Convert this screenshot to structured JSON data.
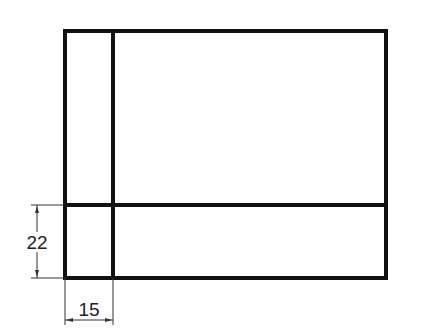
{
  "diagram": {
    "type": "technical-drawing",
    "outer_rect": {
      "x": 65,
      "y": 31,
      "width": 321,
      "height": 247
    },
    "vertical_divider_x": 113,
    "horizontal_divider_y": 205,
    "stroke_color": "#111111",
    "dimension_color": "#333333",
    "dimensions": [
      {
        "id": "height-dim",
        "label": "22",
        "orientation": "vertical"
      },
      {
        "id": "width-dim",
        "label": "15",
        "orientation": "horizontal"
      }
    ]
  }
}
